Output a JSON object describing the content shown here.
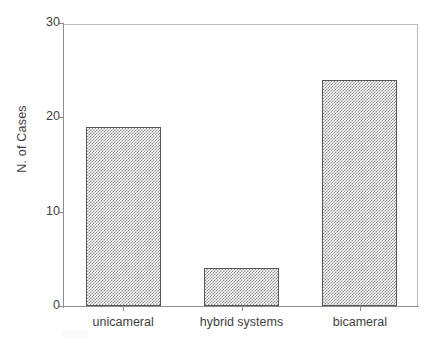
{
  "chart_data": {
    "type": "bar",
    "title": "",
    "subtitle": "",
    "xlabel": "",
    "ylabel": "N. of Cases",
    "categories": [
      "unicameral",
      "hybrid systems",
      "bicameral"
    ],
    "values": [
      19,
      4,
      24
    ],
    "ylim": [
      0,
      30
    ],
    "yticks": [
      0,
      10,
      20,
      30
    ],
    "ytick_labels": [
      "0",
      "10",
      "20",
      "30"
    ],
    "grid": false,
    "legend": null,
    "legend_position": "none",
    "bar_fill": "checkered-hatch",
    "colors": {
      "bar_fill": "#8c8c8c",
      "bar_edge": "#575757",
      "axis": "#8d8d8d",
      "frame": "#b9b9b9",
      "text": "#3f3f3f",
      "background": "#ffffff"
    }
  }
}
